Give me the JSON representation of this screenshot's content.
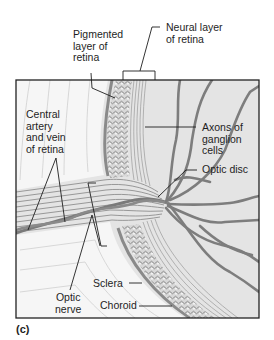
{
  "figure": {
    "panel_label": "(c)",
    "colors": {
      "frame": "#222222",
      "background_tissue": "#e3e3e3",
      "sclera_white": "#f4f4f4",
      "vessel": "#7a7a7a",
      "nerve_fibers": "#8a8a8a",
      "leader_line": "#1e1e1e"
    }
  },
  "labels": {
    "pigmented_layer": [
      "Pigmented",
      "layer of",
      "retina"
    ],
    "neural_layer": [
      "Neural layer",
      "of retina"
    ],
    "central_artery_vein": [
      "Central",
      "artery",
      "and vein",
      "of retina"
    ],
    "axons_ganglion": [
      "Axons of",
      "ganglion",
      "cells"
    ],
    "optic_disc": "Optic disc",
    "sclera": "Sclera",
    "choroid": "Choroid",
    "optic_nerve": [
      "Optic",
      "nerve"
    ]
  }
}
